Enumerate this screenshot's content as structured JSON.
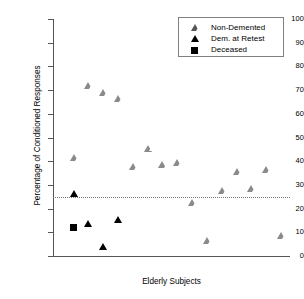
{
  "chart_data": {
    "type": "scatter",
    "title": "",
    "xlabel": "Elderly Subjects",
    "ylabel": "Percentage of Conditioned Responses",
    "ylim": [
      0,
      100
    ],
    "ytick_values": [
      0,
      10,
      20,
      30,
      40,
      50,
      60,
      70,
      80,
      90,
      100
    ],
    "ytick_labels": [
      "0",
      "10",
      "20",
      "30",
      "40",
      "50",
      "60",
      "70",
      "80",
      "90",
      "100"
    ],
    "xtick_labels": [],
    "grid": false,
    "legend_position": "top-right",
    "reference_line": {
      "label": "",
      "y": 25,
      "style": "dotted",
      "color": "#777777"
    },
    "series": [
      {
        "name": "Non-Demented",
        "marker": "triangle-open",
        "color": "#8a8a8a",
        "points": [
          {
            "x": 1,
            "y": 41.5
          },
          {
            "x": 2,
            "y": 72.0
          },
          {
            "x": 3,
            "y": 69.0
          },
          {
            "x": 4,
            "y": 66.5
          },
          {
            "x": 5,
            "y": 37.5
          },
          {
            "x": 6,
            "y": 45.5
          },
          {
            "x": 7,
            "y": 38.5
          },
          {
            "x": 8,
            "y": 39.5
          },
          {
            "x": 9,
            "y": 22.5
          },
          {
            "x": 10,
            "y": 6.5
          },
          {
            "x": 11,
            "y": 27.5
          },
          {
            "x": 12,
            "y": 35.5
          },
          {
            "x": 13,
            "y": 28.5
          },
          {
            "x": 14,
            "y": 36.5
          },
          {
            "x": 15,
            "y": 8.5
          }
        ]
      },
      {
        "name": "Dem. at Retest",
        "marker": "triangle-filled",
        "color": "#000000",
        "points": [
          {
            "x": 1,
            "y": 26.5
          },
          {
            "x": 2,
            "y": 13.5
          },
          {
            "x": 3,
            "y": 4.0
          },
          {
            "x": 4,
            "y": 15.5
          }
        ]
      },
      {
        "name": "Deceased",
        "marker": "square-filled",
        "color": "#000000",
        "points": [
          {
            "x": 1,
            "y": 12.0
          }
        ]
      }
    ]
  },
  "legend": {
    "entries": [
      {
        "label": "Non-Demented",
        "marker": "triangle-open"
      },
      {
        "label": "Dem. at Retest",
        "marker": "triangle-filled"
      },
      {
        "label": "Deceased",
        "marker": "square-filled"
      }
    ]
  },
  "axes": {
    "y_title": "Percentage of Conditioned Responses",
    "x_title": "Elderly Subjects"
  }
}
